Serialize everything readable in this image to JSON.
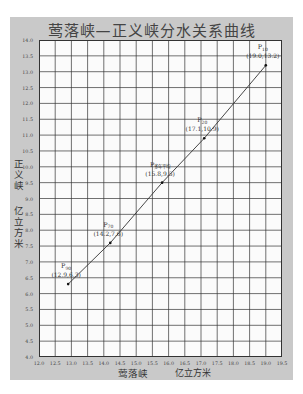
{
  "chart_data": {
    "type": "line",
    "title": "莺落峡—正义峡分水关系曲线",
    "xlabel": "莺落峡",
    "xunit": "亿立方米",
    "ylabel": "正义峡",
    "yunit": "亿立方米",
    "xlim": [
      12.0,
      19.5
    ],
    "ylim": [
      4.0,
      14.0
    ],
    "x_ticks": [
      "12.0",
      "12.5",
      "13.0",
      "13.5",
      "14.0",
      "14.5",
      "15.0",
      "15.5",
      "16.0",
      "16.5",
      "17.0",
      "17.5",
      "18.0",
      "18.5",
      "19.0",
      "19.5"
    ],
    "y_ticks": [
      "14.0",
      "13.5",
      "13.0",
      "12.5",
      "12.0",
      "11.5",
      "11.0",
      "10.5",
      "10.0",
      "9.5",
      "9.0",
      "8.5",
      "8.0",
      "7.5",
      "7.0",
      "6.5",
      "6.0",
      "5.5",
      "5.0",
      "4.5",
      "4.0"
    ],
    "grid": true,
    "series": [
      {
        "name": "分水关系曲线",
        "points": [
          {
            "label": "P90",
            "sub": "90",
            "x": 12.9,
            "y": 6.3,
            "text": "(12.9,6.3)"
          },
          {
            "label": "P70",
            "sub": "70",
            "x": 14.2,
            "y": 7.6,
            "text": "(14.2,7.6)"
          },
          {
            "label": "P多年平均",
            "sub": "多年平均",
            "x": 15.8,
            "y": 9.5,
            "text": "(15.8,9.5)"
          },
          {
            "label": "P20",
            "sub": "20",
            "x": 17.1,
            "y": 10.9,
            "text": "(17.1,10.9)"
          },
          {
            "label": "P10",
            "sub": "10",
            "x": 19.0,
            "y": 13.2,
            "text": "(19.0,13.2)"
          }
        ]
      }
    ],
    "colors": {
      "panel": "#c9c9c9",
      "grid": "#333333",
      "line": "#333333",
      "plot_bg": "#fbfbfb"
    }
  },
  "labels": {
    "title": "莺落峡—正义峡分水关系曲线",
    "ylabel_top": "正义峡",
    "ylabel_bottom": "亿立方米",
    "xlabel": "莺落峡",
    "xunit": "亿立方米"
  }
}
